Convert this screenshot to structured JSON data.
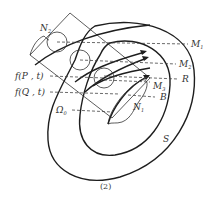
{
  "figure": {
    "caption": "(2)",
    "labels": {
      "N2": "N",
      "N2_sub": "2",
      "N1": "N",
      "N1_sub": "1",
      "M1": "M",
      "M1_sub": "1",
      "M2": "M",
      "M2_sub": "2",
      "M3": "M",
      "M3_sub": "3",
      "R": "R",
      "B": "B",
      "S": "S",
      "fP": "f(P , t)",
      "fQ": "f(Q , t)",
      "Omega": "Ω",
      "Omega_sub": "0"
    },
    "colors": {
      "stroke": "#1e1e1e",
      "text": "#333333",
      "background": "#ffffff"
    }
  }
}
